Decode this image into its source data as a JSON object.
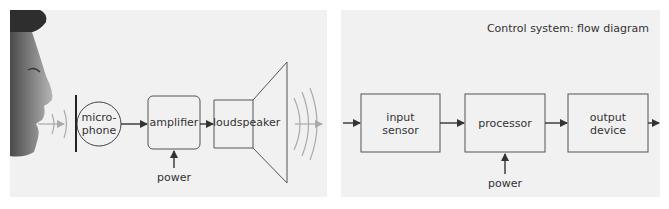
{
  "left_diagram": {
    "figure": "face-icon",
    "blocks": [
      {
        "id": "microphone",
        "label_line1": "micro-",
        "label_line2": "phone",
        "shape": "circle"
      },
      {
        "id": "amplifier",
        "label": "amplifier",
        "shape": "rounded-rect"
      },
      {
        "id": "loudspeaker",
        "label": "loudspeaker",
        "shape": "speaker"
      }
    ],
    "power_label": "power",
    "sound_wave_color": "#a9a9a9"
  },
  "right_diagram": {
    "title": "Control system: flow diagram",
    "blocks": [
      {
        "id": "input_sensor",
        "label_line1": "input",
        "label_line2": "sensor"
      },
      {
        "id": "processor",
        "label": "processor"
      },
      {
        "id": "output_device",
        "label_line1": "output",
        "label_line2": "device"
      }
    ],
    "power_label": "power"
  },
  "colors": {
    "panel_bg": "#f1f1f1",
    "stroke": "#444444",
    "text": "#333333",
    "wave": "#a9a9a9"
  }
}
